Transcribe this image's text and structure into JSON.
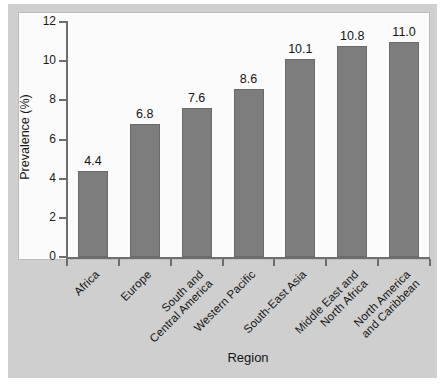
{
  "chart_data": {
    "type": "bar",
    "title": "",
    "subtitle": "",
    "xlabel": "Region",
    "ylabel": "Prevalence (%)",
    "categories": [
      "Africa",
      "Europe",
      "South and\nCentral America",
      "Western Pacific",
      "South-East Asia",
      "Middle East and\nNorth Africa",
      "North America\nand Caribbean"
    ],
    "category_lines": [
      [
        "Africa"
      ],
      [
        "Europe"
      ],
      [
        "South and",
        "Central America"
      ],
      [
        "Western Pacific"
      ],
      [
        "South-East Asia"
      ],
      [
        "Middle East and",
        "North Africa"
      ],
      [
        "North America",
        "and Caribbean"
      ]
    ],
    "values": [
      4.4,
      6.8,
      7.6,
      8.6,
      10.1,
      10.8,
      11.0
    ],
    "value_labels": [
      "4.4",
      "6.8",
      "7.6",
      "8.6",
      "10.1",
      "10.8",
      "11.0"
    ],
    "ylim": [
      0,
      12
    ],
    "yticks": [
      0,
      2,
      4,
      6,
      8,
      10,
      12
    ],
    "ytick_labels": [
      "0",
      "2",
      "4",
      "6",
      "8",
      "10",
      "12"
    ],
    "grid": false,
    "legend": null,
    "bar_color": "#7d7d7d",
    "bar_edge_color": "#6a6a6a",
    "plot_background": "#fbfbfb",
    "figure_background": "#cfcfcf",
    "axis_color": "#6e6e6e",
    "text_color": "#151515",
    "category_label_rotation": -45
  }
}
